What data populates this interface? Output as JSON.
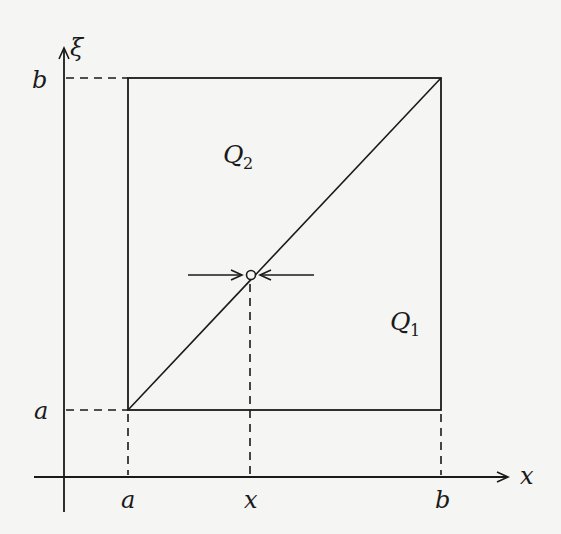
{
  "diagram": {
    "colors": {
      "stroke": "#1a1a1a",
      "background": "#f5f5f3"
    },
    "axes": {
      "horizontal_label": "x",
      "vertical_label": "ξ"
    },
    "ticks": {
      "x_left": "a",
      "x_mid": "x",
      "x_right": "b",
      "y_top": "b",
      "y_bottom": "a"
    },
    "regions": {
      "upper": {
        "letter": "Q",
        "subscript": "2"
      },
      "lower": {
        "letter": "Q",
        "subscript": "1"
      }
    },
    "point": {
      "description": "point on diagonal at ξ = x with converging arrows"
    }
  }
}
